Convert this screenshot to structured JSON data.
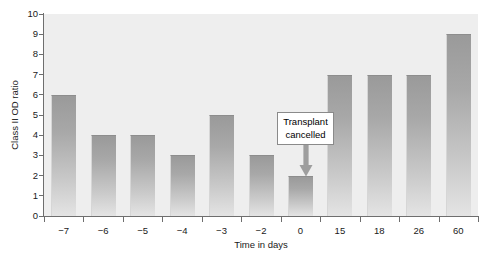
{
  "chart_data": {
    "type": "bar",
    "title": "",
    "subtitle": "",
    "xlabel": "Time in days",
    "ylabel": "Class II OD ratio",
    "categories": [
      "−7",
      "−6",
      "−5",
      "−4",
      "−3",
      "−2",
      "0",
      "15",
      "18",
      "26",
      "60"
    ],
    "values": [
      6,
      4,
      4,
      3,
      5,
      3,
      2,
      7,
      7,
      7,
      9
    ],
    "ylim": [
      0,
      10
    ],
    "y_ticks": [
      "0",
      "1",
      "2",
      "3",
      "4",
      "5",
      "6",
      "7",
      "8",
      "9",
      "10"
    ],
    "y_tick_values": [
      0,
      1,
      2,
      3,
      4,
      5,
      6,
      7,
      8,
      9,
      10
    ],
    "grid": false,
    "legend": null,
    "annotations": [
      {
        "text_line1": "Transplant",
        "text_line2": "cancelled",
        "points_to_category": "0",
        "arrow_direction": "down"
      }
    ],
    "colors": {
      "plot_background": "#eeeeee",
      "bar_top": "#9a9a9a",
      "bar_bottom": "#e4e4e4",
      "axis": "#6e6e6e",
      "text": "#1a1a1a",
      "annotation_border": "#8a8a8a",
      "annotation_background": "#ffffff",
      "arrow": "#9e9e9e"
    }
  }
}
